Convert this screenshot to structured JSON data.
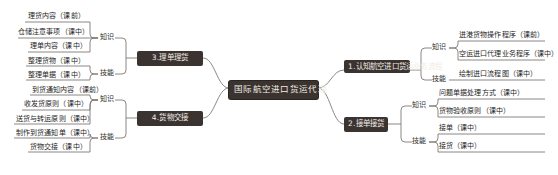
{
  "mindmap": {
    "root": {
      "label": "国际航空进口货运代理"
    },
    "branches": [
      {
        "id": "branch-1",
        "label": "1.认知航空进口货运业务流程",
        "side": "right",
        "groups": [
          {
            "label": "知识",
            "items": [
              {
                "label": "进港货物操作程序（课前）"
              },
              {
                "label": "空运进口代理业务程序（课中）"
              }
            ]
          },
          {
            "label": "技能",
            "items": [
              {
                "label": "绘制进口流程图（课中）"
              }
            ]
          }
        ]
      },
      {
        "id": "branch-2",
        "label": "2.接单接货",
        "side": "right",
        "groups": [
          {
            "label": "知识",
            "items": [
              {
                "label": "问题单据处理方式（课中）"
              },
              {
                "label": "货物验收原则（课中）"
              }
            ]
          },
          {
            "label": "技能",
            "items": [
              {
                "label": "接单（课中）"
              },
              {
                "label": "接货（课中）"
              }
            ]
          }
        ]
      },
      {
        "id": "branch-3",
        "label": "3.理单理货",
        "side": "left",
        "groups": [
          {
            "label": "知识",
            "items": [
              {
                "label": "理货内容（课前）"
              },
              {
                "label": "仓储注意事项（课中）"
              },
              {
                "label": "理单内容（课中）"
              }
            ]
          },
          {
            "label": "技能",
            "items": [
              {
                "label": "整理货物（课中）"
              },
              {
                "label": "整理单据（课中）"
              }
            ]
          }
        ]
      },
      {
        "id": "branch-4",
        "label": "4.货物交接",
        "side": "left",
        "groups": [
          {
            "label": "知识",
            "items": [
              {
                "label": "到货通知内容（课前）"
              },
              {
                "label": "收发货原则（课中）"
              },
              {
                "label": "送货与转运原则（课中）"
              }
            ]
          },
          {
            "label": "技能",
            "items": [
              {
                "label": "制作到货通知单（课中）"
              },
              {
                "label": "货物交接（课中）"
              }
            ]
          }
        ]
      }
    ],
    "colors": {
      "node_fill": "#3a3330",
      "node_text": "#f2ece6",
      "line": "#6e6a66",
      "leaf_text": "#1d1d1d",
      "background": "#ffffff"
    }
  }
}
